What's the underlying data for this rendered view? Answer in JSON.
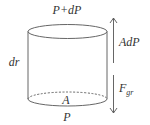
{
  "diagram": {
    "labels": {
      "top_pressure": "P+dP",
      "bottom_pressure": "P",
      "height": "dr",
      "area": "A",
      "pressure_force": "AdP",
      "gravity_force_base": "F",
      "gravity_force_sub": "gr"
    },
    "colors": {
      "stroke": "#555555",
      "text": "#333333",
      "background": "#ffffff"
    },
    "elements": {
      "cylinder": "cylinder-shape",
      "up_arrow": "arrow-up-icon",
      "down_arrow": "arrow-down-icon"
    }
  }
}
